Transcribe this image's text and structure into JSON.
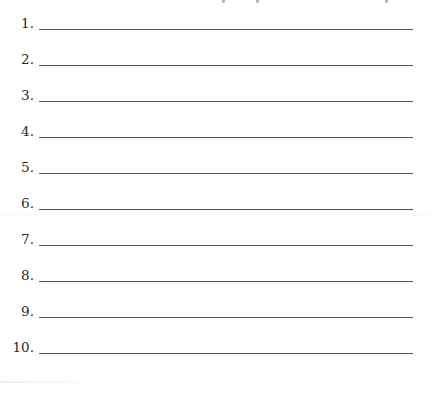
{
  "worksheet": {
    "items": [
      {
        "number": "1.",
        "answer": ""
      },
      {
        "number": "2.",
        "answer": ""
      },
      {
        "number": "3.",
        "answer": ""
      },
      {
        "number": "4.",
        "answer": ""
      },
      {
        "number": "5.",
        "answer": ""
      },
      {
        "number": "6.",
        "answer": ""
      },
      {
        "number": "7.",
        "answer": ""
      },
      {
        "number": "8.",
        "answer": ""
      },
      {
        "number": "9.",
        "answer": ""
      },
      {
        "number": "10.",
        "answer": ""
      }
    ]
  }
}
